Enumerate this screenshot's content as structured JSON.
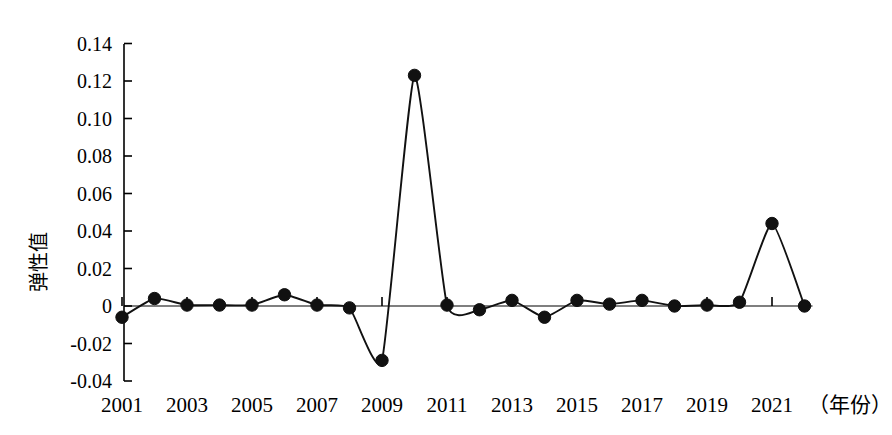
{
  "chart_data": {
    "type": "line",
    "title": "",
    "subtitle": "",
    "xlabel": "（年份）",
    "ylabel": "弹性值",
    "x": [
      2001,
      2002,
      2003,
      2004,
      2005,
      2006,
      2007,
      2008,
      2009,
      2010,
      2011,
      2012,
      2013,
      2014,
      2015,
      2016,
      2017,
      2018,
      2019,
      2020,
      2021,
      2022
    ],
    "values": [
      -0.006,
      0.004,
      0.0005,
      0.0005,
      0.0005,
      0.006,
      0.0005,
      -0.001,
      -0.029,
      0.123,
      0.0005,
      -0.002,
      0.003,
      -0.006,
      0.003,
      0.001,
      0.003,
      0.0,
      0.0005,
      0.002,
      0.044,
      0.0
    ],
    "series": [
      {
        "name": "弹性值",
        "values": [
          -0.006,
          0.004,
          0.0005,
          0.0005,
          0.0005,
          0.006,
          0.0005,
          -0.001,
          -0.029,
          0.123,
          0.0005,
          -0.002,
          0.003,
          -0.006,
          0.003,
          0.001,
          0.003,
          0.0,
          0.0005,
          0.002,
          0.044,
          0.0
        ]
      }
    ],
    "xlim": [
      2000.4,
      2022.4
    ],
    "ylim": [
      -0.04,
      0.14
    ],
    "y_ticks": [
      -0.04,
      -0.02,
      0,
      0.02,
      0.04,
      0.06,
      0.08,
      0.1,
      0.12,
      0.14
    ],
    "y_tick_labels": [
      "-0.04",
      "-0.02",
      "0",
      "0.02",
      "0.04",
      "0.06",
      "0.08",
      "0.10",
      "0.12",
      "0.14"
    ],
    "x_ticks": [
      2001,
      2003,
      2005,
      2007,
      2009,
      2011,
      2013,
      2015,
      2017,
      2019,
      2021
    ],
    "x_tick_labels": [
      "2001",
      "2003",
      "2005",
      "2007",
      "2009",
      "2011",
      "2013",
      "2015",
      "2017",
      "2019",
      "2021"
    ],
    "grid": false,
    "legend": false,
    "legend_position": "none",
    "marker": "filled-circle",
    "line_color": "#111111",
    "marker_color": "#111111",
    "background_color": "#ffffff",
    "interpolation": "smooth-spline"
  },
  "axes": {
    "x_axis_unit_label": "（年份）",
    "y_axis_title": "弹性值"
  }
}
